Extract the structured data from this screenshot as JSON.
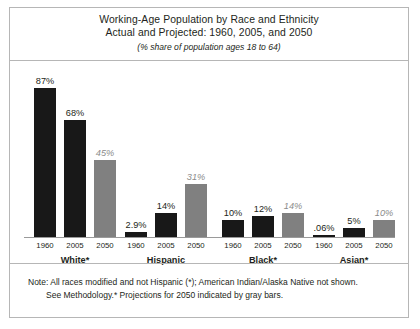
{
  "chart_data": {
    "type": "bar",
    "title": "Working-Age Population by Race and Ethnicity",
    "title_line2": "Actual and Projected: 1960, 2005, and 2050",
    "subtitle": "(% share of population ages 18 to 64)",
    "xlabel": "",
    "ylabel": "",
    "ylim": [
      0,
      100
    ],
    "grid": false,
    "legend": "none",
    "categories": [
      "White*",
      "Hispanic",
      "Black*",
      "Asian*"
    ],
    "x": [
      "1960",
      "2005",
      "2050"
    ],
    "series": [
      {
        "name": "1960",
        "kind": "actual",
        "color": "#181818",
        "values": [
          87,
          2.9,
          10,
          0.06
        ],
        "labels": [
          "87%",
          "2.9%",
          "10%",
          ".06%"
        ]
      },
      {
        "name": "2005",
        "kind": "actual",
        "color": "#181818",
        "values": [
          68,
          14,
          12,
          5
        ],
        "labels": [
          "68%",
          "14%",
          "12%",
          "5%"
        ]
      },
      {
        "name": "2050",
        "kind": "projected",
        "color": "#808080",
        "values": [
          45,
          31,
          14,
          10
        ],
        "labels": [
          "45%",
          "31%",
          "14%",
          "10%"
        ]
      }
    ],
    "annotations": [
      "Note: All races modified and not Hispanic (*); American Indian/Alaska Native not shown.",
      "See Methodology.* Projections for 2050 indicated by gray bars."
    ]
  },
  "note": {
    "line1": "Note: All races modified and not Hispanic (*); American Indian/Alaska Native not shown.",
    "line2": "See Methodology.* Projections for 2050 indicated by gray bars."
  },
  "colors": {
    "actual": "#181818",
    "projected": "#808080",
    "border": "#b6b6b6",
    "text": "#231f20",
    "proj_label": "#8c8c8c"
  }
}
